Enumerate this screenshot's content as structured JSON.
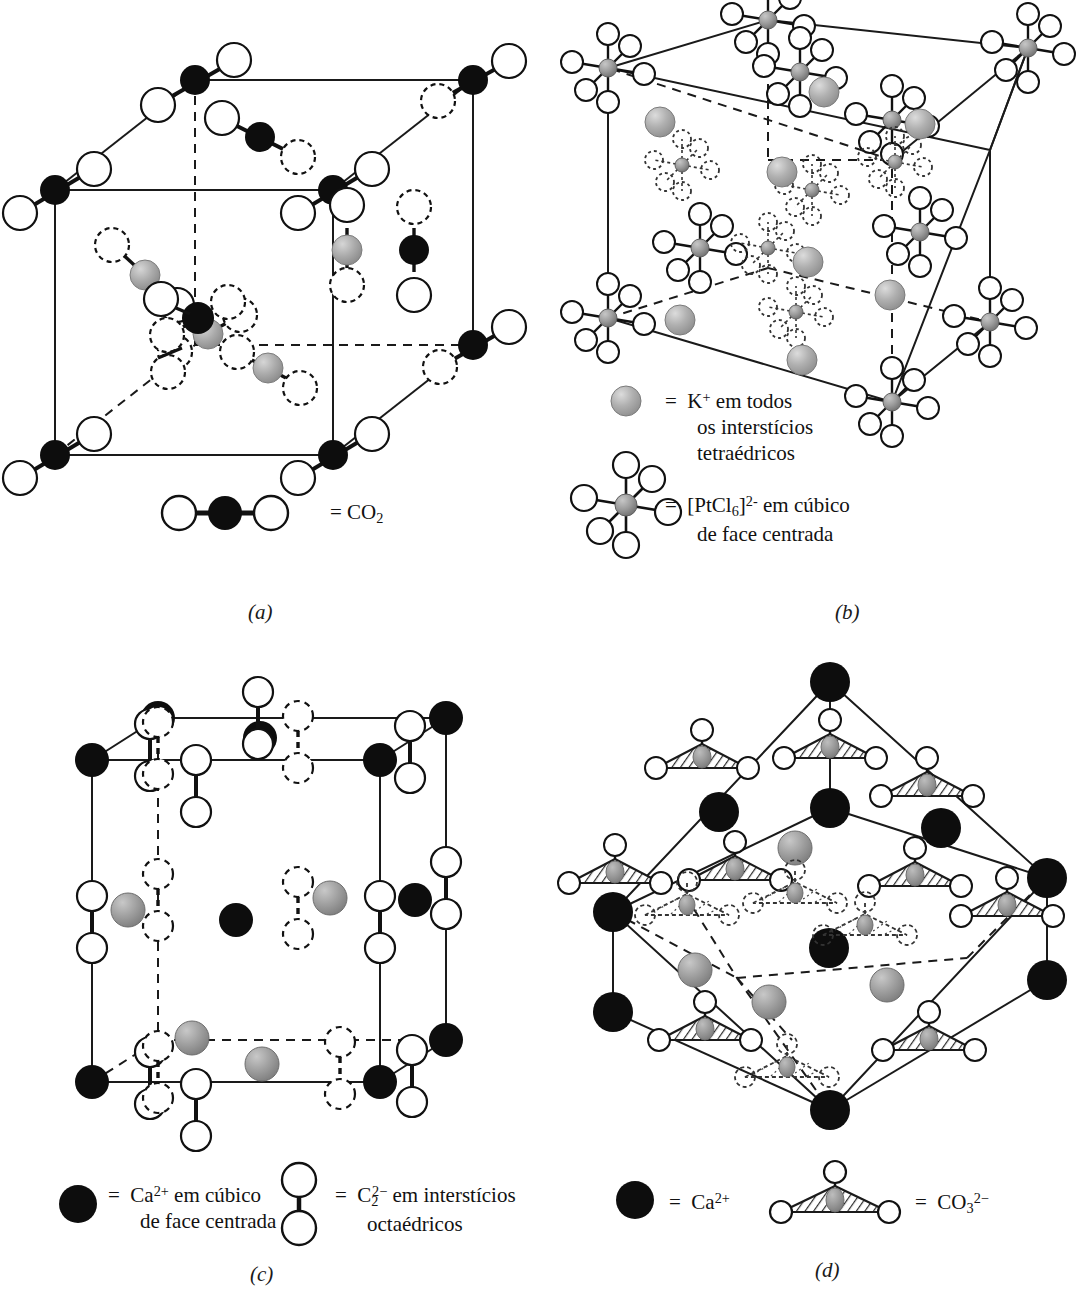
{
  "figure": {
    "kind": "crystal-structure-plate",
    "panel_count": 4,
    "background": "#ffffff"
  },
  "colors": {
    "line": "#1a1a1a",
    "black_atom": "#0d0d0d",
    "gray_atom": "#a6a6a6",
    "gray_atom_dark": "#8a8a8a",
    "white_atom": "#ffffff",
    "hatch": "#2b2b2b",
    "text": "#111111"
  },
  "panels": [
    {
      "id": "a",
      "label": "(a)",
      "compound": "CO2",
      "description": "Dioxido de carbono solido - gelo seco, cubico de face centrada",
      "legend": [
        {
          "glyph": "co2-linear-molecule",
          "equals": "=",
          "formula_html": "CO<sub>2</sub>",
          "formula_text": "CO2"
        }
      ]
    },
    {
      "id": "b",
      "label": "(b)",
      "compound": "K2PtCl6",
      "description": "Hexacloroplatinato de potassio, estrutura antifluorita",
      "legend": [
        {
          "glyph": "gray-sphere",
          "equals": "=",
          "formula_html": "K<sup>+</sup>",
          "formula_text": "K+",
          "caption": "em todos\nos interstícios\ntetraédricos"
        },
        {
          "glyph": "octahedral-cluster",
          "equals": "=",
          "formula_html": "[PtCl<sub>6</sub>]<sup>2-</sup>",
          "formula_text": "[PtCl6]2-",
          "caption": "em cúbico\nde face centrada"
        }
      ]
    },
    {
      "id": "c",
      "label": "(c)",
      "compound": "CaC2",
      "description": "Carbureto de calcio, celula tetragonal alongada",
      "legend": [
        {
          "glyph": "black-sphere",
          "equals": "=",
          "formula_html": "Ca<sup>2+</sup>",
          "formula_text": "Ca2+",
          "caption": "em cúbico\nde face centrada"
        },
        {
          "glyph": "c2-dumbbell",
          "equals": "=",
          "formula_html": "C<sub>2</sub><sup>2&#8722;</sup>",
          "formula_text": "C2 2-",
          "caption": "em interstícios\noctaédricos"
        }
      ]
    },
    {
      "id": "d",
      "label": "(d)",
      "compound": "CaCO3",
      "description": "Calcita, celula romboedrica",
      "legend": [
        {
          "glyph": "black-sphere",
          "equals": "=",
          "formula_html": "Ca<sup>2+</sup>",
          "formula_text": "Ca2+",
          "caption": ""
        },
        {
          "glyph": "carbonate-triangle",
          "equals": "=",
          "formula_html": "CO<sub>3</sub><sup>2&#8722;</sup>",
          "formula_text": "CO3 2-",
          "caption": ""
        }
      ]
    }
  ],
  "legend_b": {
    "line1_formula": "K",
    "line1_charge": "+",
    "line1_rest": " em todos",
    "line2": "os interstícios",
    "line3": "tetraédricos",
    "line4_formula_open": "[PtCl",
    "line4_sub": "6",
    "line4_close": "]",
    "line4_charge": "2-",
    "line4_rest": " em cúbico",
    "line5": "de face centrada",
    "equals": "="
  },
  "legend_c": {
    "equals": "=",
    "ca_formula": "Ca",
    "ca_charge": "2+",
    "ca_rest": " em cúbico",
    "ca_line2": "de face centrada",
    "c2_formula": "C",
    "c2_sub": "2",
    "c2_charge": "2−",
    "c2_rest": " em interstícios",
    "c2_line2": "octaédricos"
  },
  "legend_d": {
    "equals": "=",
    "ca_formula": "Ca",
    "ca_charge": "2+",
    "co3_formula": "CO",
    "co3_sub": "3",
    "co3_charge": "2−"
  },
  "legend_a": {
    "equals": "=",
    "formula": "CO",
    "sub": "2"
  }
}
